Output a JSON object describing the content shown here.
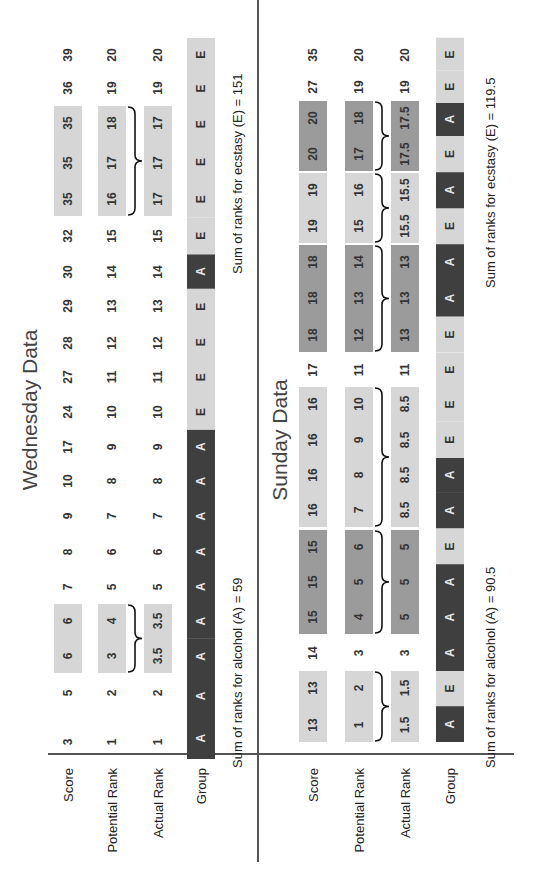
{
  "colors": {
    "light": "#d6d6d6",
    "medium": "#9b9b9b",
    "dark": "#3f3f3f",
    "text_on_dark": "#e8e8e8",
    "text_on_light": "#333333"
  },
  "row_labels": [
    "Score",
    "Potential Rank",
    "Actual Rank",
    "Group"
  ],
  "wednesday": {
    "title": "Wednesday Data",
    "score": [
      "3",
      "5",
      "6",
      "6",
      "7",
      "8",
      "9",
      "10",
      "17",
      "24",
      "27",
      "28",
      "29",
      "30",
      "32",
      "35",
      "35",
      "35",
      "36",
      "39"
    ],
    "potential_rank": [
      "1",
      "2",
      "3",
      "4",
      "5",
      "6",
      "7",
      "8",
      "9",
      "10",
      "11",
      "12",
      "13",
      "14",
      "15",
      "16",
      "17",
      "18",
      "19",
      "20"
    ],
    "actual_rank": [
      "1",
      "2",
      "3.5",
      "3.5",
      "5",
      "6",
      "7",
      "8",
      "9",
      "10",
      "11",
      "12",
      "13",
      "14",
      "15",
      "17",
      "17",
      "17",
      "19",
      "20"
    ],
    "group": [
      "A",
      "A",
      "A",
      "A",
      "A",
      "A",
      "A",
      "A",
      "A",
      "E",
      "E",
      "E",
      "E",
      "A",
      "E",
      "E",
      "E",
      "E",
      "E",
      "E"
    ],
    "tie_groups": [
      {
        "from": 2,
        "to": 3,
        "shade": "light"
      },
      {
        "from": 15,
        "to": 17,
        "shade": "light"
      }
    ],
    "sum_alcohol": "Sum of ranks for alcohol (A) = 59",
    "sum_ecstasy": "Sum of ranks for ecstasy (E) = 151"
  },
  "sunday": {
    "title": "Sunday Data",
    "score": [
      "13",
      "13",
      "14",
      "15",
      "15",
      "15",
      "16",
      "16",
      "16",
      "16",
      "17",
      "18",
      "18",
      "18",
      "19",
      "19",
      "20",
      "20",
      "27",
      "35"
    ],
    "potential_rank": [
      "1",
      "2",
      "3",
      "4",
      "5",
      "6",
      "7",
      "8",
      "9",
      "10",
      "11",
      "12",
      "13",
      "14",
      "15",
      "16",
      "17",
      "18",
      "19",
      "20"
    ],
    "actual_rank": [
      "1.5",
      "1.5",
      "3",
      "5",
      "5",
      "5",
      "8.5",
      "8.5",
      "8.5",
      "8.5",
      "11",
      "13",
      "13",
      "13",
      "15.5",
      "15.5",
      "17.5",
      "17.5",
      "19",
      "20"
    ],
    "group": [
      "A",
      "E",
      "A",
      "A",
      "A",
      "E",
      "A",
      "A",
      "E",
      "E",
      "E",
      "E",
      "A",
      "A",
      "E",
      "A",
      "E",
      "A",
      "E",
      "E"
    ],
    "tie_groups": [
      {
        "from": 0,
        "to": 1,
        "shade": "light"
      },
      {
        "from": 3,
        "to": 5,
        "shade": "medium"
      },
      {
        "from": 6,
        "to": 9,
        "shade": "light"
      },
      {
        "from": 11,
        "to": 13,
        "shade": "medium"
      },
      {
        "from": 14,
        "to": 15,
        "shade": "light"
      },
      {
        "from": 16,
        "to": 17,
        "shade": "medium"
      }
    ],
    "sum_alcohol": "Sum of ranks for alcohol (A) = 90.5",
    "sum_ecstasy": "Sum of ranks for ecstasy (E) = 119.5"
  }
}
